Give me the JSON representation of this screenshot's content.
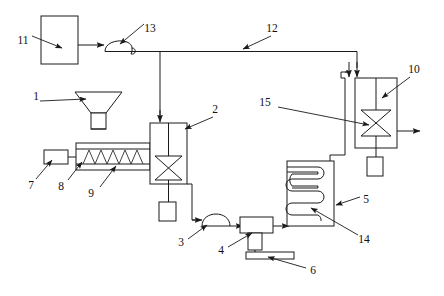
{
  "figure": {
    "type": "patent-process-flow-diagram",
    "title": "",
    "background_color": "#ffffff",
    "line_color": "#1a1a1a",
    "callout_labels": [
      {
        "id": "c1",
        "number": "1",
        "x": 36,
        "y": 97,
        "target": "hopper"
      },
      {
        "id": "c2",
        "number": "2",
        "x": 215,
        "y": 110,
        "target": "main-reactor"
      },
      {
        "id": "c3",
        "number": "3",
        "x": 181,
        "y": 243,
        "target": "pump-lower"
      },
      {
        "id": "c4",
        "number": "4",
        "x": 221,
        "y": 251,
        "target": "tee-fitting"
      },
      {
        "id": "c5",
        "number": "5",
        "x": 366,
        "y": 200,
        "target": "heat-exchanger-shell"
      },
      {
        "id": "c6",
        "number": "6",
        "x": 313,
        "y": 271,
        "target": "discharge-plate"
      },
      {
        "id": "c7",
        "number": "7",
        "x": 31,
        "y": 186,
        "target": "drive-motor"
      },
      {
        "id": "c8",
        "number": "8",
        "x": 61,
        "y": 187,
        "target": "extruder-barrel"
      },
      {
        "id": "c9",
        "number": "9",
        "x": 91,
        "y": 194,
        "target": "extruder-screw"
      },
      {
        "id": "c10",
        "number": "10",
        "x": 414,
        "y": 70,
        "target": "secondary-reactor"
      },
      {
        "id": "c11",
        "number": "11",
        "x": 23,
        "y": 41,
        "target": "supply-tank"
      },
      {
        "id": "c12",
        "number": "12",
        "x": 272,
        "y": 29,
        "target": "top-feed-line"
      },
      {
        "id": "c13",
        "number": "13",
        "x": 150,
        "y": 29,
        "target": "pump-upper"
      },
      {
        "id": "c14",
        "number": "14",
        "x": 364,
        "y": 240,
        "target": "coil-tube"
      },
      {
        "id": "c15",
        "number": "15",
        "x": 265,
        "y": 103,
        "target": "secondary-agitator"
      }
    ],
    "components": [
      {
        "name": "supply-tank",
        "shape": "rectangle",
        "x": 41,
        "y": 16,
        "w": 37,
        "h": 48
      },
      {
        "name": "pump-upper",
        "shape": "pump-arc",
        "cx": 118,
        "cy": 48
      },
      {
        "name": "top-feed-line",
        "shape": "polyline"
      },
      {
        "name": "hopper",
        "shape": "funnel",
        "cx": 98,
        "cy": 104
      },
      {
        "name": "drive-motor",
        "shape": "rectangle",
        "x": 44,
        "y": 150,
        "w": 24,
        "h": 14
      },
      {
        "name": "extruder-barrel",
        "shape": "rectangle",
        "x": 76,
        "y": 143,
        "w": 74,
        "h": 27
      },
      {
        "name": "extruder-screw",
        "shape": "zigzag"
      },
      {
        "name": "main-reactor",
        "shape": "rectangle",
        "x": 150,
        "y": 123,
        "w": 37,
        "h": 61
      },
      {
        "name": "main-agitator",
        "shape": "bowtie"
      },
      {
        "name": "main-reactor-base",
        "shape": "rectangle",
        "x": 159,
        "y": 202,
        "w": 17,
        "h": 19
      },
      {
        "name": "pump-lower",
        "shape": "pump-arc",
        "cx": 213,
        "cy": 220
      },
      {
        "name": "tee-fitting",
        "shape": "tee",
        "x": 240,
        "y": 216
      },
      {
        "name": "discharge-plate",
        "shape": "bar",
        "x": 246,
        "y": 252,
        "w": 48,
        "h": 7
      },
      {
        "name": "heat-exchanger-shell",
        "shape": "rectangle",
        "x": 287,
        "y": 161,
        "w": 47,
        "h": 65
      },
      {
        "name": "coil-tube",
        "shape": "serpentine",
        "turns": 4
      },
      {
        "name": "secondary-reactor",
        "shape": "rectangle",
        "x": 355,
        "y": 78,
        "w": 42,
        "h": 70
      },
      {
        "name": "secondary-agitator",
        "shape": "bowtie"
      },
      {
        "name": "secondary-reactor-base",
        "shape": "rectangle",
        "x": 367,
        "y": 157,
        "w": 16,
        "h": 19
      },
      {
        "name": "recycle-line",
        "shape": "polyline"
      },
      {
        "name": "product-outlet-arrow",
        "shape": "arrow"
      }
    ]
  }
}
